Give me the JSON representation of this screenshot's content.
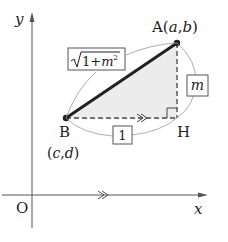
{
  "diagram": {
    "axes": {
      "x_label": "x",
      "y_label": "y",
      "origin_label": "O"
    },
    "points": {
      "A": {
        "name": "A",
        "coords": "(a,b)",
        "coord_vars": [
          "a",
          "b"
        ]
      },
      "B": {
        "name": "B",
        "coords": "(c,d)",
        "coord_vars": [
          "c",
          "d"
        ]
      },
      "H": {
        "name": "H"
      }
    },
    "lengths": {
      "hypotenuse": {
        "radical": "1+m",
        "exponent": "2",
        "full": "√(1+m²)"
      },
      "horizontal": "1",
      "vertical": "m"
    },
    "marks": {
      "parallel_mark": "≫",
      "right_angle_at": "H"
    },
    "colors": {
      "ink": "#222222",
      "axis": "#555555",
      "shade": "#e8e8e8",
      "arc": "#999999"
    }
  }
}
